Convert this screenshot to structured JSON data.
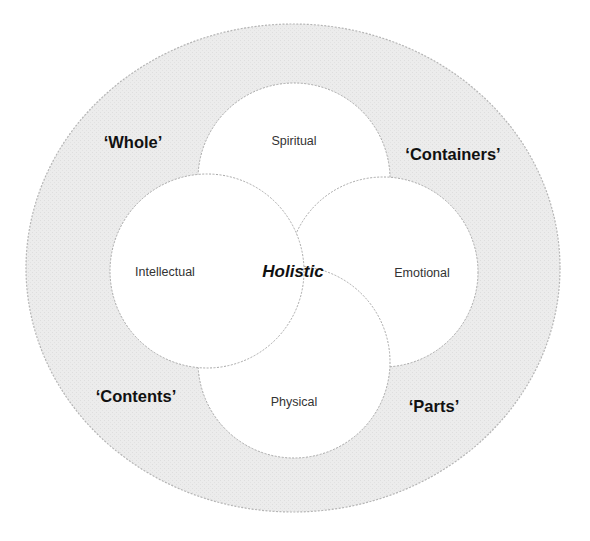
{
  "diagram": {
    "title": "Holistic",
    "center_label": "Holistic",
    "domains": [
      {
        "id": "spiritual",
        "label": "Spiritual",
        "position": "top"
      },
      {
        "id": "intellectual",
        "label": "Intellectual",
        "position": "left"
      },
      {
        "id": "emotional",
        "label": "Emotional",
        "position": "right"
      },
      {
        "id": "physical",
        "label": "Physical",
        "position": "bottom"
      }
    ],
    "outer_labels": [
      {
        "id": "whole",
        "label": "‘Whole’",
        "position": "top-left"
      },
      {
        "id": "containers",
        "label": "‘Containers’",
        "position": "top-right"
      },
      {
        "id": "contents",
        "label": "‘Contents’",
        "position": "bottom-left"
      },
      {
        "id": "parts",
        "label": "‘Parts’",
        "position": "bottom-right"
      }
    ],
    "colors": {
      "outer_ring_fill": "#ececec",
      "outer_ring_stroke": "#b5b5b5",
      "inner_circle_fill": "#ffffff",
      "inner_circle_stroke": "#b0b0b0",
      "text": "#111111"
    }
  }
}
